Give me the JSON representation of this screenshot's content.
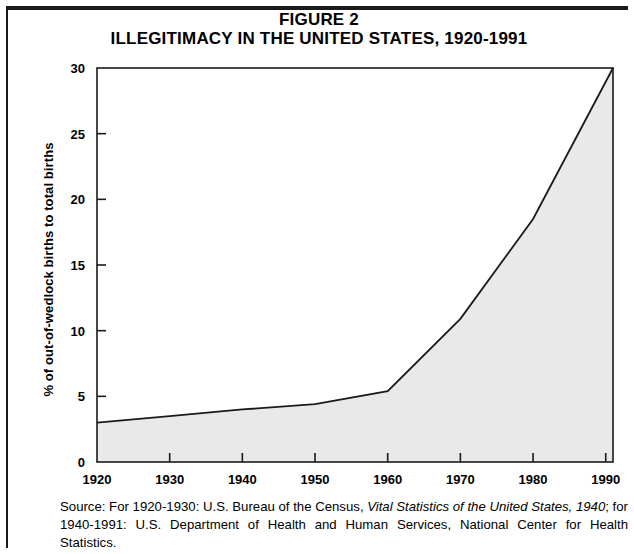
{
  "figure": {
    "label": "FIGURE 2",
    "title": "ILLEGITIMACY IN THE UNITED STATES, 1920-1991"
  },
  "source": {
    "prefix": "Source: For 1920-1930: U.S. Bureau of the Census, ",
    "italic_one": "Vital Statistics of the United States, 1940",
    "middle": "; for 1940-1991: U.S. Department of Health and Human Services, National Center for Health Statistics.",
    "full": "Source: For 1920-1930: U.S. Bureau of the Census, Vital Statistics of the United States, 1940; for 1940-1991: U.S. Department of Health and Human Services, National Center for Health Statistics."
  },
  "colors": {
    "line": "#1a1a1a",
    "fill": "#e9e9e9",
    "axis": "#1a1a1a",
    "text": "#000000",
    "background": "#ffffff"
  },
  "chart_data": {
    "type": "area",
    "title": "ILLEGITIMACY IN THE UNITED STATES, 1920-1991",
    "subtitle": "FIGURE 2",
    "xlabel": "",
    "ylabel": "% of out-of-wedlock births to total births",
    "xlim": [
      1920,
      1991
    ],
    "ylim": [
      0,
      30
    ],
    "grid": false,
    "legend": null,
    "x_ticks": [
      1920,
      1930,
      1940,
      1950,
      1960,
      1970,
      1980,
      1990
    ],
    "x_tick_labels": [
      "1920",
      "1930",
      "1940",
      "1950",
      "1960",
      "1970",
      "1980",
      "1990"
    ],
    "y_ticks": [
      0,
      5,
      10,
      15,
      20,
      25,
      30
    ],
    "y_tick_labels": [
      "0",
      "5",
      "10",
      "15",
      "20",
      "25",
      "30"
    ],
    "x": [
      1920,
      1930,
      1940,
      1950,
      1960,
      1970,
      1980,
      1991
    ],
    "values": [
      3.0,
      3.5,
      4.0,
      4.4,
      5.4,
      10.9,
      18.5,
      30.0
    ],
    "series": [
      {
        "name": "% of out-of-wedlock births to total births",
        "x": [
          1920,
          1930,
          1940,
          1950,
          1960,
          1970,
          1980,
          1991
        ],
        "values": [
          3.0,
          3.5,
          4.0,
          4.4,
          5.4,
          10.9,
          18.5,
          30.0
        ]
      }
    ]
  }
}
